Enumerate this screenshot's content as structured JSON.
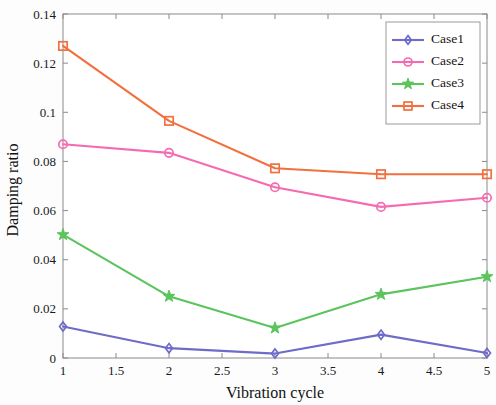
{
  "chart_data": {
    "type": "line",
    "title": "",
    "xlabel": "Vibration cycle",
    "ylabel": "Damping ratio",
    "x": [
      1,
      2,
      3,
      4,
      5
    ],
    "xlim": [
      1,
      5
    ],
    "ylim": [
      0,
      0.14
    ],
    "xticks": [
      "1",
      "1.5",
      "2",
      "2.5",
      "3",
      "3.5",
      "4",
      "4.5",
      "5"
    ],
    "xtick_values": [
      1,
      1.5,
      2,
      2.5,
      3,
      3.5,
      4,
      4.5,
      5
    ],
    "yticks": [
      "0",
      "0.02",
      "0.04",
      "0.06",
      "0.08",
      "0.1",
      "0.12",
      "0.14"
    ],
    "ytick_values": [
      0,
      0.02,
      0.04,
      0.06,
      0.08,
      0.1,
      0.12,
      0.14
    ],
    "grid": false,
    "legend_position": "upper right",
    "series": [
      {
        "name": "Case1",
        "values": [
          0.0128,
          0.004,
          0.0018,
          0.0095,
          0.002
        ],
        "color": "#6f6bc8",
        "marker": "diamond"
      },
      {
        "name": "Case2",
        "values": [
          0.087,
          0.0835,
          0.0695,
          0.0615,
          0.0652
        ],
        "color": "#f56bb0",
        "marker": "circle"
      },
      {
        "name": "Case3",
        "values": [
          0.0502,
          0.0251,
          0.0122,
          0.0259,
          0.0331
        ],
        "color": "#5cc45c",
        "marker": "star"
      },
      {
        "name": "Case4",
        "values": [
          0.127,
          0.0965,
          0.0772,
          0.0748,
          0.0748
        ],
        "color": "#f2703f",
        "marker": "square"
      }
    ]
  }
}
